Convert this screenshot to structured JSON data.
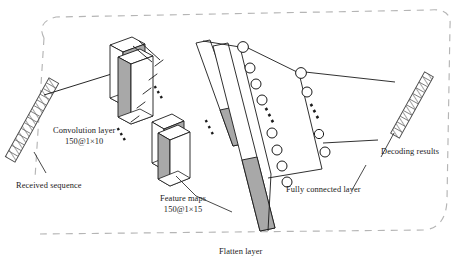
{
  "figure": {
    "type": "neural-network-architecture-diagram",
    "background_color": "#ffffff",
    "line_color": "#1a1a1a",
    "fill_gray": "#a8a8a8",
    "fill_light": "#d9d9d9",
    "dashed_border_color": "#b5b5b5"
  },
  "labels": {
    "received_sequence": "Received sequence",
    "convolution_layer": "Convolution layer",
    "convolution_layer_shape": "150@1×10",
    "feature_maps": "Feature maps",
    "feature_maps_shape": "150@1×15",
    "flatten_layer": "Flatten layer",
    "fully_connected_layer": "Fully connected layer",
    "decoding_results": "Decoding results"
  },
  "elements": {
    "input_bar": {
      "name": "received-sequence-bar",
      "style": "hatched-segmented-bar",
      "rotation_deg": -61,
      "segments": 14
    },
    "output_bar": {
      "name": "decoding-results-bar",
      "style": "hatched-segmented-bar",
      "rotation_deg": -61,
      "segments": 11
    },
    "conv_blocks": {
      "name": "convolution-layer-blocks",
      "count": 2,
      "ellipsis": "⋰"
    },
    "feature_map_blocks": {
      "name": "feature-map-blocks",
      "count": 2,
      "ellipsis": "⋰"
    },
    "flatten_bars": {
      "name": "flatten-layer-bars",
      "count": 2,
      "ellipsis": "⋰"
    },
    "fc_layer_1": {
      "name": "fully-connected-column-1",
      "neuron_count": 7,
      "has_ellipsis": true
    },
    "fc_layer_2": {
      "name": "fully-connected-column-2",
      "neuron_count": 6,
      "has_ellipsis": true
    }
  }
}
